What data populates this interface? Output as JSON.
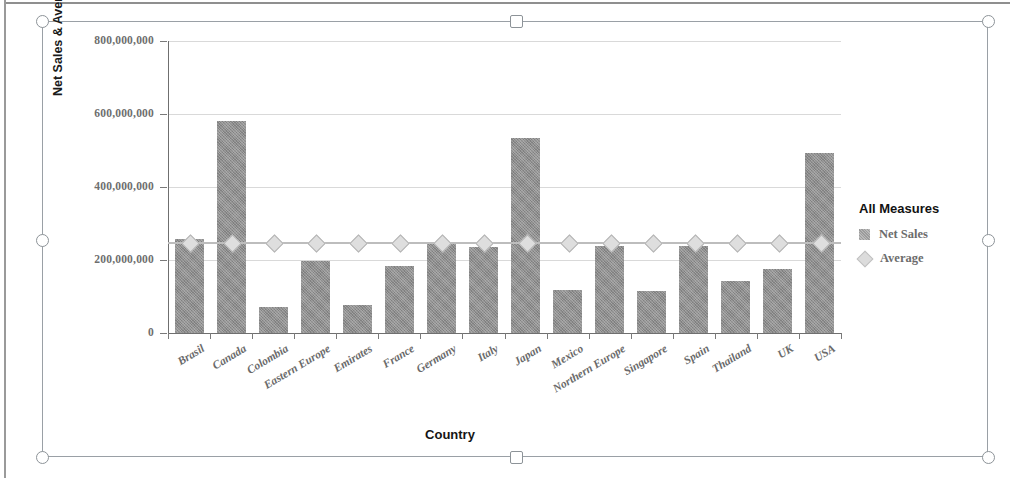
{
  "chart_data": {
    "type": "bar",
    "title": "",
    "xlabel": "Country",
    "ylabel": "Net Sales & Average",
    "ylim": [
      0,
      800000000
    ],
    "yticks": [
      "0",
      "200,000,000",
      "400,000,000",
      "600,000,000",
      "800,000,000"
    ],
    "ytick_values": [
      0,
      200000000,
      400000000,
      600000000,
      800000000
    ],
    "grid": true,
    "legend_position": "right",
    "categories": [
      "Brasil",
      "Canada",
      "Colombia",
      "Eastern Europe",
      "Emirates",
      "France",
      "Germany",
      "Italy",
      "Japan",
      "Mexico",
      "Northern Europe",
      "Singapore",
      "Spain",
      "Thailand",
      "UK",
      "USA"
    ],
    "series": [
      {
        "name": "Net Sales",
        "type": "bar",
        "color": "#8f8f8f",
        "values": [
          258000000,
          582000000,
          70000000,
          198000000,
          76000000,
          184000000,
          245000000,
          235000000,
          533000000,
          117000000,
          238000000,
          114000000,
          238000000,
          142000000,
          174000000,
          492000000
        ]
      },
      {
        "name": "Average",
        "type": "line",
        "color": "#c8c8c8",
        "values": [
          250000000,
          250000000,
          250000000,
          250000000,
          250000000,
          250000000,
          250000000,
          250000000,
          250000000,
          250000000,
          250000000,
          250000000,
          250000000,
          250000000,
          250000000,
          250000000
        ]
      }
    ]
  },
  "legend": {
    "title": "All Measures",
    "entries": [
      {
        "label": "Net Sales",
        "marker": "square-swatch"
      },
      {
        "label": "Average",
        "marker": "diamond-swatch"
      }
    ]
  },
  "selection": {
    "handles": [
      "top-left",
      "top-center",
      "top-right",
      "middle-left",
      "middle-right",
      "bottom-left",
      "bottom-center",
      "bottom-right"
    ]
  }
}
